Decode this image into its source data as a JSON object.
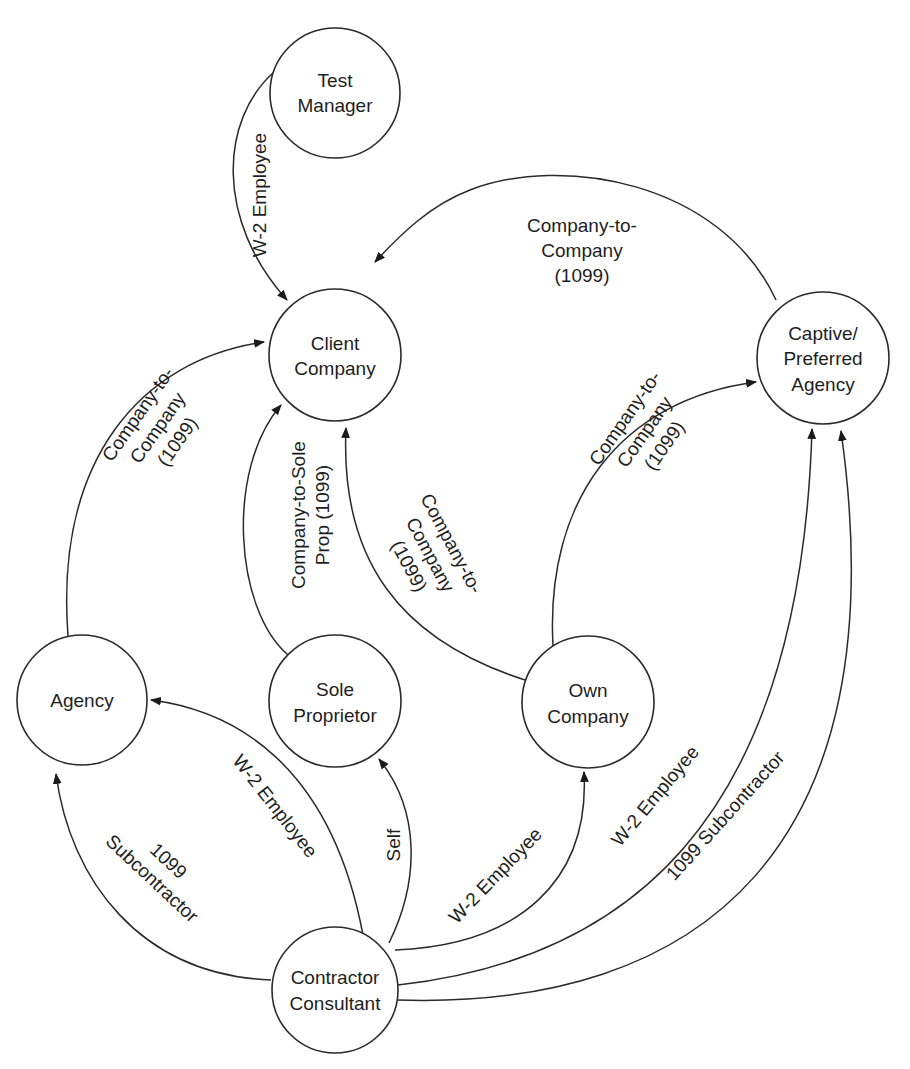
{
  "diagram": {
    "type": "relationship-graph",
    "colors": {
      "stroke": "#2a2a2a",
      "text": "#1e1e1e",
      "background": "#ffffff"
    },
    "nodes": {
      "test_manager": {
        "lines": [
          "Test",
          "Manager"
        ]
      },
      "client_company": {
        "lines": [
          "Client",
          "Company"
        ]
      },
      "captive_agency": {
        "lines": [
          "Captive/",
          "Preferred",
          "Agency"
        ]
      },
      "agency": {
        "lines": [
          "Agency"
        ]
      },
      "sole_proprietor": {
        "lines": [
          "Sole",
          "Proprietor"
        ]
      },
      "own_company": {
        "lines": [
          "Own",
          "Company"
        ]
      },
      "contractor": {
        "lines": [
          "Contractor",
          "Consultant"
        ]
      }
    },
    "edges": {
      "tm_to_client": {
        "from": "Test Manager",
        "to": "Client Company",
        "lines": [
          "W-2 Employee"
        ]
      },
      "captive_to_client": {
        "from": "Captive/Preferred Agency",
        "to": "Client Company",
        "lines": [
          "Company-to-",
          "Company",
          "(1099)"
        ]
      },
      "agency_to_client": {
        "from": "Agency",
        "to": "Client Company",
        "lines": [
          "Company-to-",
          "Company",
          "(1099)"
        ]
      },
      "sole_to_client": {
        "from": "Sole Proprietor",
        "to": "Client Company",
        "lines": [
          "Company-to-Sole",
          "Prop (1099)"
        ]
      },
      "own_to_client": {
        "from": "Own Company",
        "to": "Client Company",
        "lines": [
          "Company-to-",
          "Company",
          "(1099)"
        ]
      },
      "own_to_captive": {
        "from": "Own Company",
        "to": "Captive/Preferred Agency",
        "lines": [
          "Company-to-",
          "Company",
          "(1099)"
        ]
      },
      "contractor_to_agency_w2": {
        "from": "Contractor Consultant",
        "to": "Agency",
        "lines": [
          "W-2 Employee"
        ]
      },
      "contractor_to_agency_1099": {
        "from": "Contractor Consultant",
        "to": "Agency",
        "lines": [
          "1099",
          "Subcontractor"
        ]
      },
      "contractor_to_sole": {
        "from": "Contractor Consultant",
        "to": "Sole Proprietor",
        "lines": [
          "Self"
        ]
      },
      "contractor_to_own": {
        "from": "Contractor Consultant",
        "to": "Own Company",
        "lines": [
          "W-2 Employee"
        ]
      },
      "contractor_to_captive_w2": {
        "from": "Contractor Consultant",
        "to": "Captive/Preferred Agency",
        "lines": [
          "W-2 Employee"
        ]
      },
      "contractor_to_captive_1099": {
        "from": "Contractor Consultant",
        "to": "Captive/Preferred Agency",
        "lines": [
          "1099 Subcontractor"
        ]
      }
    }
  }
}
